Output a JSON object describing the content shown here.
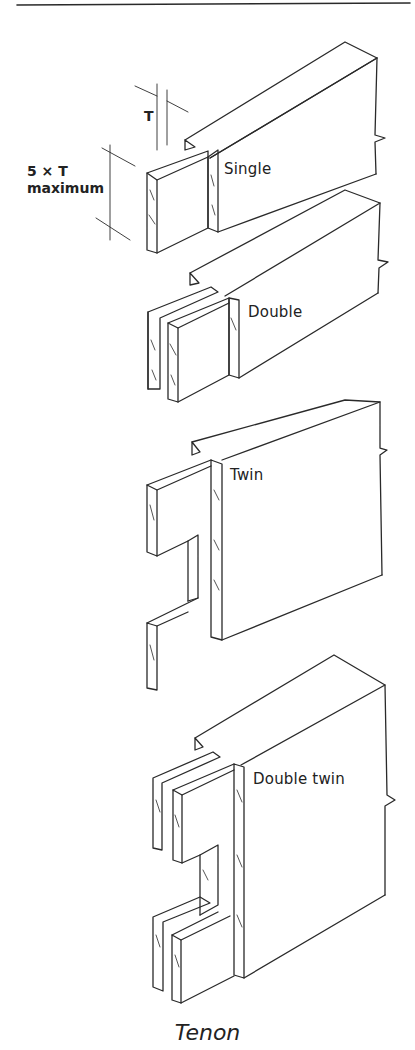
{
  "figure": {
    "caption": "Tenon",
    "dimension": {
      "thickness_label": "T",
      "height_label_line1": "5 × T",
      "height_label_line2": "maximum"
    },
    "variants": [
      {
        "label": "Single"
      },
      {
        "label": "Double"
      },
      {
        "label": "Twin"
      },
      {
        "label": "Double twin"
      }
    ]
  }
}
